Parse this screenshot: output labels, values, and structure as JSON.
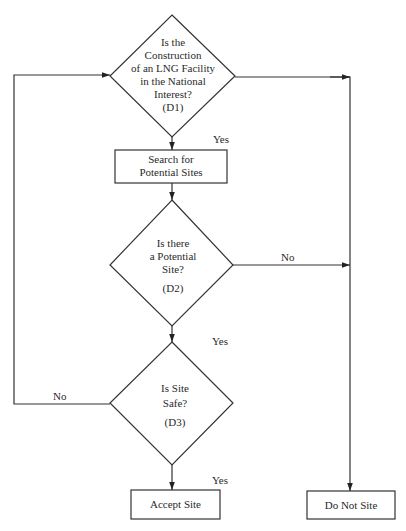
{
  "diagram": {
    "type": "flowchart",
    "decisions": [
      {
        "id": "D1",
        "lines": [
          "Is the",
          "Construction",
          "of an LNG Facility",
          "in the National",
          "Interest?",
          "(D1)"
        ]
      },
      {
        "id": "D2",
        "lines": [
          "Is there",
          "a Potential",
          "Site?",
          "",
          "(D2)"
        ]
      },
      {
        "id": "D3",
        "lines": [
          "Is Site",
          "Safe?",
          "",
          "(D3)"
        ]
      }
    ],
    "processes": [
      {
        "id": "search",
        "lines": [
          "Search for",
          "Potential Sites"
        ]
      },
      {
        "id": "accept",
        "lines": [
          "Accept Site"
        ]
      },
      {
        "id": "reject",
        "lines": [
          "Do Not Site"
        ]
      }
    ],
    "edge_labels": {
      "d1_yes": "Yes",
      "d2_no": "No",
      "d2_yes": "Yes",
      "d3_no": "No",
      "d3_yes": "Yes"
    },
    "edges": [
      {
        "from": "D1",
        "to": "search",
        "label": "Yes"
      },
      {
        "from": "D1",
        "to": "reject",
        "label": ""
      },
      {
        "from": "search",
        "to": "D2",
        "label": ""
      },
      {
        "from": "D2",
        "to": "reject",
        "label": "No"
      },
      {
        "from": "D2",
        "to": "D3",
        "label": "Yes"
      },
      {
        "from": "D3",
        "to": "D1",
        "label": "No"
      },
      {
        "from": "D3",
        "to": "accept",
        "label": "Yes"
      }
    ],
    "colors": {
      "line": "#333333",
      "background": "#ffffff"
    }
  }
}
